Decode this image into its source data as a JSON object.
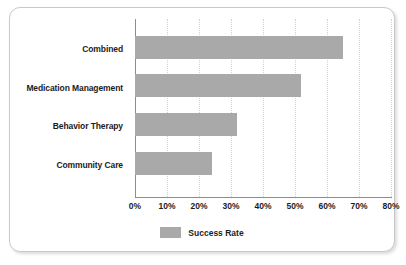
{
  "chart_data": {
    "type": "bar",
    "orientation": "horizontal",
    "title": "",
    "xlabel": "",
    "ylabel": "",
    "categories": [
      "Combined",
      "Medication Management",
      "Behavior Therapy",
      "Community Care"
    ],
    "values": [
      65,
      52,
      32,
      24
    ],
    "series": [
      {
        "name": "Success Rate",
        "values": [
          65,
          52,
          32,
          24
        ],
        "color": "#a9a9a9"
      }
    ],
    "xlim": [
      0,
      80
    ],
    "xticks": [
      0,
      10,
      20,
      30,
      40,
      50,
      60,
      70,
      80
    ],
    "xtick_labels": [
      "0%",
      "10%",
      "20%",
      "30%",
      "40%",
      "50%",
      "60%",
      "70%",
      "80%"
    ],
    "value_suffix": "%",
    "grid": "vertical-dotted",
    "legend": {
      "position": "bottom-center",
      "entries": [
        {
          "label": "Success Rate",
          "color": "#a9a9a9"
        }
      ]
    }
  },
  "styles": {
    "bar_color": "#a9a9a9",
    "axis_color": "#8d8d8d",
    "grid_color": "#d2d2d2",
    "text_color": "#1c1c1c",
    "card_border_color": "#c9c9c9",
    "background": "#ffffff"
  }
}
